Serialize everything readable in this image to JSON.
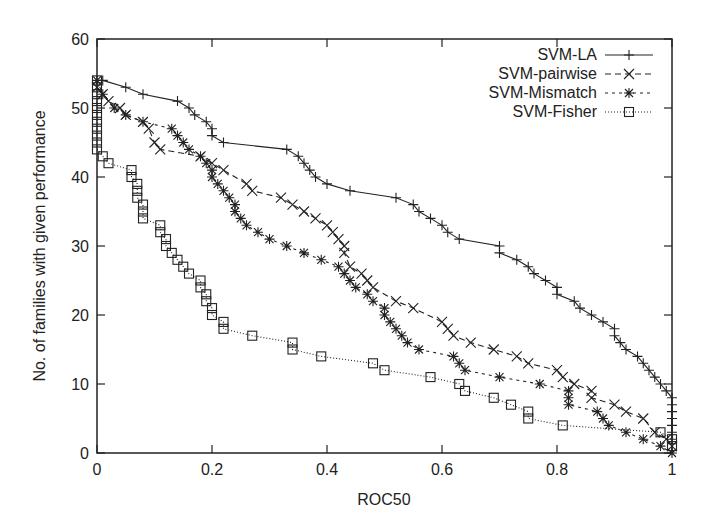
{
  "chart_data": {
    "type": "line",
    "title": "",
    "xlabel": "ROC50",
    "ylabel": "No. of families with given performance",
    "xlim": [
      0,
      1
    ],
    "ylim": [
      0,
      60
    ],
    "xticks": [
      "0",
      "0.2",
      "0.4",
      "0.6",
      "0.8",
      "1"
    ],
    "xtick_values": [
      0,
      0.2,
      0.4,
      0.6,
      0.8,
      1
    ],
    "yticks": [
      "0",
      "10",
      "20",
      "30",
      "40",
      "50",
      "60"
    ],
    "ytick_values": [
      0,
      10,
      20,
      30,
      40,
      50,
      60
    ],
    "grid": false,
    "legend_position": "top-right",
    "series": [
      {
        "name": "SVM-LA",
        "line_style": "solid",
        "marker": "plus",
        "x": [
          0.01,
          0.05,
          0.08,
          0.14,
          0.16,
          0.17,
          0.19,
          0.2,
          0.2,
          0.22,
          0.33,
          0.35,
          0.36,
          0.37,
          0.38,
          0.4,
          0.44,
          0.52,
          0.55,
          0.56,
          0.58,
          0.6,
          0.61,
          0.63,
          0.7,
          0.7,
          0.73,
          0.75,
          0.76,
          0.78,
          0.8,
          0.8,
          0.83,
          0.84,
          0.86,
          0.88,
          0.9,
          0.9,
          0.91,
          0.92,
          0.94,
          0.95,
          0.96,
          0.97,
          0.98,
          0.99,
          1.0,
          1.0,
          1.0,
          1.0,
          1.0,
          1.0,
          1.0
        ],
        "y": [
          54,
          53,
          52,
          51,
          50,
          49,
          48,
          47,
          46,
          45,
          44,
          43,
          42,
          41,
          40,
          39,
          38,
          37,
          36,
          35,
          34,
          33,
          32,
          31,
          30,
          29,
          28,
          27,
          26,
          25,
          24,
          23,
          22,
          21,
          20,
          19,
          18,
          17,
          16,
          15,
          14,
          13,
          12,
          11,
          10,
          9,
          8,
          7,
          6,
          5,
          4,
          3,
          2
        ]
      },
      {
        "name": "SVM-pairwise",
        "line_style": "dashed",
        "marker": "x",
        "x": [
          0.0,
          0.01,
          0.02,
          0.04,
          0.05,
          0.08,
          0.09,
          0.1,
          0.11,
          0.18,
          0.2,
          0.22,
          0.26,
          0.27,
          0.32,
          0.34,
          0.36,
          0.38,
          0.4,
          0.41,
          0.42,
          0.43,
          0.43,
          0.44,
          0.46,
          0.47,
          0.48,
          0.52,
          0.55,
          0.6,
          0.61,
          0.62,
          0.65,
          0.69,
          0.73,
          0.75,
          0.8,
          0.81,
          0.83,
          0.86,
          0.86,
          0.9,
          0.92,
          0.95,
          0.97,
          0.99,
          1.0
        ],
        "y": [
          53,
          52,
          51,
          50,
          49,
          48,
          47,
          45,
          44,
          43,
          42,
          41,
          39,
          38,
          37,
          36,
          35,
          34,
          33,
          32,
          31,
          30,
          29,
          27,
          26,
          25,
          24,
          22,
          21,
          19,
          18,
          17,
          16,
          15,
          14,
          13,
          12,
          11,
          10,
          9,
          8,
          7,
          6,
          5,
          3,
          2,
          1
        ]
      },
      {
        "name": "SVM-Mismatch",
        "line_style": "short-dashed",
        "marker": "star",
        "x": [
          0.0,
          0.01,
          0.03,
          0.05,
          0.08,
          0.13,
          0.14,
          0.15,
          0.16,
          0.18,
          0.19,
          0.2,
          0.2,
          0.21,
          0.22,
          0.23,
          0.24,
          0.24,
          0.25,
          0.26,
          0.28,
          0.3,
          0.33,
          0.36,
          0.39,
          0.42,
          0.43,
          0.44,
          0.45,
          0.47,
          0.48,
          0.5,
          0.5,
          0.51,
          0.52,
          0.53,
          0.54,
          0.56,
          0.62,
          0.63,
          0.64,
          0.7,
          0.77,
          0.82,
          0.82,
          0.82,
          0.87,
          0.88,
          0.89,
          0.92,
          0.95,
          0.98,
          1.0
        ],
        "y": [
          54,
          52,
          50,
          49,
          48,
          47,
          46,
          45,
          44,
          43,
          42,
          41,
          40,
          39,
          38,
          37,
          36,
          35,
          34,
          33,
          32,
          31,
          30,
          29,
          28,
          27,
          26,
          25,
          24,
          23,
          22,
          21,
          20,
          19,
          18,
          17,
          16,
          15,
          14,
          13,
          12,
          11,
          10,
          9,
          8,
          7,
          6,
          5,
          4,
          3,
          2,
          1,
          0
        ]
      },
      {
        "name": "SVM-Fisher",
        "line_style": "dotted",
        "marker": "square",
        "x": [
          0.0,
          0.0,
          0.0,
          0.0,
          0.0,
          0.0,
          0.0,
          0.0,
          0.0,
          0.0,
          0.0,
          0.01,
          0.02,
          0.06,
          0.06,
          0.07,
          0.07,
          0.07,
          0.08,
          0.08,
          0.08,
          0.11,
          0.11,
          0.12,
          0.12,
          0.13,
          0.14,
          0.15,
          0.16,
          0.18,
          0.18,
          0.19,
          0.19,
          0.2,
          0.2,
          0.22,
          0.22,
          0.27,
          0.34,
          0.34,
          0.39,
          0.48,
          0.5,
          0.58,
          0.63,
          0.64,
          0.69,
          0.72,
          0.75,
          0.75,
          0.81,
          0.98,
          1.0,
          1.0
        ],
        "y": [
          54,
          53,
          52,
          51,
          50,
          49,
          48,
          47,
          46,
          45,
          44,
          43,
          42,
          41,
          40,
          39,
          38,
          37,
          36,
          35,
          34,
          33,
          32,
          31,
          30,
          29,
          28,
          27,
          26,
          25,
          24,
          23,
          22,
          21,
          20,
          19,
          18,
          17,
          16,
          15,
          14,
          13,
          12,
          11,
          10,
          9,
          8,
          7,
          6,
          5,
          4,
          3,
          2,
          1
        ]
      }
    ]
  }
}
